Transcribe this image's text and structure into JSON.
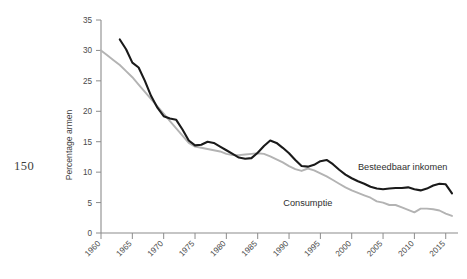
{
  "page": {
    "number": "150"
  },
  "chart_data": {
    "type": "line",
    "title": "",
    "xlabel": "",
    "ylabel": "Percentage armen",
    "xlim": [
      1960,
      2016
    ],
    "ylim": [
      0,
      35
    ],
    "ytick_labels": [
      "0",
      "5",
      "10",
      "15",
      "20",
      "25",
      "30",
      "35"
    ],
    "ytick_values": [
      0,
      5,
      10,
      15,
      20,
      25,
      30,
      35
    ],
    "xtick_labels": [
      "1960",
      "1965",
      "1970",
      "1975",
      "1980",
      "1985",
      "1990",
      "1995",
      "2000",
      "2005",
      "2010",
      "2015"
    ],
    "xtick_values": [
      1960,
      1965,
      1970,
      1975,
      1980,
      1985,
      1990,
      1995,
      2000,
      2005,
      2010,
      2015
    ],
    "grid": false,
    "legend_position": "inline-annotation",
    "colors": {
      "besteedbaar_inkomen": "#1a1a1a",
      "consumptie": "#b3b3b3",
      "axis": "#8c8c8c"
    },
    "series": [
      {
        "name": "Besteedbaar inkomen",
        "color": "#1a1a1a",
        "label_x": 2001,
        "label_y": 10.4,
        "x": [
          1963,
          1964,
          1965,
          1966,
          1967,
          1968,
          1969,
          1970,
          1971,
          1972,
          1973,
          1974,
          1975,
          1976,
          1977,
          1978,
          1979,
          1980,
          1981,
          1982,
          1983,
          1984,
          1985,
          1986,
          1987,
          1988,
          1989,
          1990,
          1991,
          1992,
          1993,
          1994,
          1995,
          1996,
          1997,
          1998,
          1999,
          2000,
          2001,
          2002,
          2003,
          2004,
          2005,
          2006,
          2007,
          2008,
          2009,
          2010,
          2011,
          2012,
          2013,
          2014,
          2015,
          2016
        ],
        "y": [
          31.8,
          30.2,
          28.0,
          27.2,
          25.0,
          22.5,
          20.6,
          19.2,
          18.8,
          18.6,
          17.0,
          15.2,
          14.4,
          14.5,
          15.0,
          14.8,
          14.2,
          13.6,
          13.0,
          12.4,
          12.2,
          12.3,
          13.2,
          14.3,
          15.2,
          14.8,
          14.0,
          13.1,
          12.0,
          11.0,
          10.9,
          11.2,
          11.8,
          12.0,
          11.3,
          10.4,
          9.6,
          9.0,
          8.5,
          8.1,
          7.6,
          7.3,
          7.2,
          7.3,
          7.4,
          7.4,
          7.5,
          7.2,
          7.0,
          7.3,
          7.8,
          8.1,
          8.0,
          6.5
        ]
      },
      {
        "name": "Consumptie",
        "color": "#b3b3b3",
        "label_x": 1993,
        "label_y": 4.4,
        "x": [
          1960,
          1961,
          1962,
          1963,
          1964,
          1965,
          1966,
          1967,
          1968,
          1969,
          1970,
          1971,
          1972,
          1973,
          1974,
          1975,
          1976,
          1977,
          1978,
          1979,
          1980,
          1981,
          1982,
          1983,
          1984,
          1985,
          1986,
          1987,
          1988,
          1989,
          1990,
          1991,
          1992,
          1993,
          1994,
          1995,
          1996,
          1997,
          1998,
          1999,
          2000,
          2001,
          2002,
          2003,
          2004,
          2005,
          2006,
          2007,
          2008,
          2009,
          2010,
          2011,
          2012,
          2013,
          2014,
          2015,
          2016
        ],
        "y": [
          30.0,
          29.2,
          28.4,
          27.6,
          26.6,
          25.6,
          24.4,
          23.2,
          22.0,
          20.8,
          19.6,
          18.4,
          17.2,
          16.0,
          14.8,
          14.2,
          14.0,
          13.8,
          13.6,
          13.4,
          13.0,
          12.8,
          12.8,
          12.9,
          13.0,
          13.1,
          13.0,
          12.6,
          12.1,
          11.6,
          11.0,
          10.5,
          10.2,
          10.6,
          10.3,
          9.8,
          9.3,
          8.7,
          8.1,
          7.5,
          7.0,
          6.6,
          6.2,
          5.8,
          5.2,
          5.0,
          4.6,
          4.6,
          4.2,
          3.8,
          3.4,
          4.0,
          4.0,
          3.9,
          3.7,
          3.2,
          2.8
        ]
      }
    ]
  }
}
